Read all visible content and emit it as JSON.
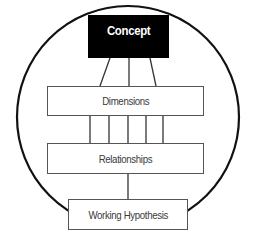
{
  "diagram": {
    "type": "hierarchy-in-circle",
    "nodes": [
      {
        "id": "concept",
        "label": "Concept",
        "style": "filled-black"
      },
      {
        "id": "dimensions",
        "label": "Dimensions",
        "style": "outlined"
      },
      {
        "id": "relationships",
        "label": "Relationships",
        "style": "outlined"
      },
      {
        "id": "hypothesis",
        "label": "Working Hypothesis",
        "style": "outlined"
      }
    ],
    "edges": [
      {
        "from": "concept",
        "to": "dimensions",
        "count": 3
      },
      {
        "from": "dimensions",
        "to": "relationships",
        "count": 5
      },
      {
        "from": "relationships",
        "to": "hypothesis",
        "count": 1
      }
    ],
    "enclosure": "circle",
    "colors": {
      "concept_fill": "#000000",
      "concept_text": "#ffffff",
      "line": "#222222",
      "box_border": "#555555",
      "text": "#3a3a3a"
    }
  }
}
